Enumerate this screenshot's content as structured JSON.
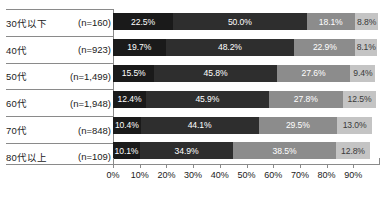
{
  "chart_data": {
    "type": "bar",
    "orientation": "horizontal",
    "stacked": true,
    "title": "",
    "subtitle": "",
    "xlabel": "",
    "ylabel": "",
    "xlim": [
      0,
      100
    ],
    "grid": false,
    "legend_position": "none",
    "xticks": [
      "0%",
      "10%",
      "20%",
      "30%",
      "40%",
      "50%",
      "60%",
      "70%",
      "80%",
      "90%"
    ],
    "xtick_values": [
      0,
      10,
      20,
      30,
      40,
      50,
      60,
      70,
      80,
      90
    ],
    "categories": [
      "30代以下",
      "40代",
      "50代",
      "60代",
      "70代",
      "80代以上"
    ],
    "category_counts": [
      "(n=160)",
      "(n=923)",
      "(n=1,499)",
      "(n=1,948)",
      "(n=848)",
      "(n=109)"
    ],
    "series": [
      {
        "name": "series-1",
        "color": "#1a1a1a",
        "values": [
          22.5,
          19.7,
          15.5,
          12.4,
          10.4,
          10.1
        ]
      },
      {
        "name": "series-2",
        "color": "#2e2e2e",
        "values": [
          50.0,
          48.2,
          45.8,
          45.9,
          44.1,
          34.9
        ]
      },
      {
        "name": "series-3",
        "color": "#8c8c8c",
        "values": [
          18.1,
          22.9,
          27.6,
          27.8,
          29.5,
          38.5
        ]
      },
      {
        "name": "series-4",
        "color": "#c4c4c4",
        "values": [
          8.8,
          8.1,
          9.4,
          12.5,
          13.0,
          12.8
        ]
      }
    ],
    "rows": [
      {
        "name": "30代以下",
        "count": "(n=160)",
        "segments": [
          {
            "label": "22.5%",
            "value": 22.5,
            "color": "#1a1a1a",
            "text_color": "#ffffff"
          },
          {
            "label": "50.0%",
            "value": 50.0,
            "color": "#2e2e2e",
            "text_color": "#ffffff"
          },
          {
            "label": "18.1%",
            "value": 18.1,
            "color": "#8c8c8c",
            "text_color": "#ffffff"
          },
          {
            "label": "8.8%",
            "value": 8.8,
            "color": "#c4c4c4",
            "text_color": "#3a3a3a"
          }
        ]
      },
      {
        "name": "40代",
        "count": "(n=923)",
        "segments": [
          {
            "label": "19.7%",
            "value": 19.7,
            "color": "#1a1a1a",
            "text_color": "#ffffff"
          },
          {
            "label": "48.2%",
            "value": 48.2,
            "color": "#2e2e2e",
            "text_color": "#ffffff"
          },
          {
            "label": "22.9%",
            "value": 22.9,
            "color": "#8c8c8c",
            "text_color": "#ffffff"
          },
          {
            "label": "8.1%",
            "value": 8.1,
            "color": "#c4c4c4",
            "text_color": "#3a3a3a"
          }
        ]
      },
      {
        "name": "50代",
        "count": "(n=1,499)",
        "segments": [
          {
            "label": "15.5%",
            "value": 15.5,
            "color": "#1a1a1a",
            "text_color": "#ffffff"
          },
          {
            "label": "45.8%",
            "value": 45.8,
            "color": "#2e2e2e",
            "text_color": "#ffffff"
          },
          {
            "label": "27.6%",
            "value": 27.6,
            "color": "#8c8c8c",
            "text_color": "#ffffff"
          },
          {
            "label": "9.4%",
            "value": 9.4,
            "color": "#c4c4c4",
            "text_color": "#3a3a3a"
          }
        ]
      },
      {
        "name": "60代",
        "count": "(n=1,948)",
        "segments": [
          {
            "label": "12.4%",
            "value": 12.4,
            "color": "#1a1a1a",
            "text_color": "#ffffff"
          },
          {
            "label": "45.9%",
            "value": 45.9,
            "color": "#2e2e2e",
            "text_color": "#ffffff"
          },
          {
            "label": "27.8%",
            "value": 27.8,
            "color": "#8c8c8c",
            "text_color": "#ffffff"
          },
          {
            "label": "12.5%",
            "value": 12.5,
            "color": "#c4c4c4",
            "text_color": "#3a3a3a"
          }
        ]
      },
      {
        "name": "70代",
        "count": "(n=848)",
        "segments": [
          {
            "label": "10.4%",
            "value": 10.4,
            "color": "#1a1a1a",
            "text_color": "#ffffff"
          },
          {
            "label": "44.1%",
            "value": 44.1,
            "color": "#2e2e2e",
            "text_color": "#ffffff"
          },
          {
            "label": "29.5%",
            "value": 29.5,
            "color": "#8c8c8c",
            "text_color": "#ffffff"
          },
          {
            "label": "13.0%",
            "value": 13.0,
            "color": "#c4c4c4",
            "text_color": "#3a3a3a"
          }
        ]
      },
      {
        "name": "80代以上",
        "count": "(n=109)",
        "segments": [
          {
            "label": "10.1%",
            "value": 10.1,
            "color": "#1a1a1a",
            "text_color": "#ffffff"
          },
          {
            "label": "34.9%",
            "value": 34.9,
            "color": "#2e2e2e",
            "text_color": "#ffffff"
          },
          {
            "label": "38.5%",
            "value": 38.5,
            "color": "#8c8c8c",
            "text_color": "#ffffff"
          },
          {
            "label": "12.8%",
            "value": 12.8,
            "color": "#c4c4c4",
            "text_color": "#3a3a3a"
          }
        ]
      }
    ]
  },
  "colors": {
    "axis": "#8a8a8a",
    "text": "#1a1a1a",
    "background": "#ffffff"
  }
}
